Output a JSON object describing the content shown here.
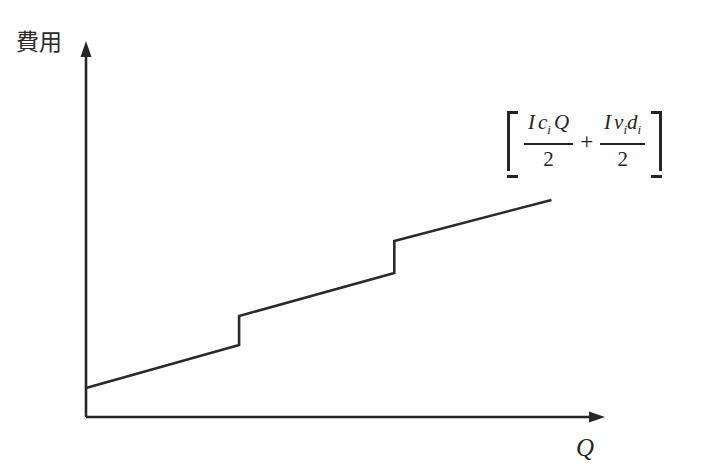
{
  "chart_data": {
    "type": "line",
    "title": "",
    "subtitle": "",
    "xlabel": "Q",
    "ylabel": "費用",
    "grid": false,
    "legend": null,
    "axis_style": "arrow-headed axes, no tick marks, no numeric tick labels",
    "xlim": [
      0,
      1
    ],
    "ylim": [
      0,
      1
    ],
    "series": [
      {
        "name": "total cost",
        "segments": [
          {
            "x": [
              0.0,
              0.295
            ],
            "y": [
              0.078,
              0.193
            ]
          },
          {
            "x": [
              0.295,
              0.295
            ],
            "y": [
              0.193,
              0.271
            ]
          },
          {
            "x": [
              0.295,
              0.594
            ],
            "y": [
              0.271,
              0.386
            ]
          },
          {
            "x": [
              0.594,
              0.594
            ],
            "y": [
              0.386,
              0.472
            ]
          },
          {
            "x": [
              0.594,
              0.897
            ],
            "y": [
              0.472,
              0.582
            ]
          }
        ],
        "jumps_at_x": [
          0.295,
          0.594
        ]
      }
    ],
    "annotations": [
      {
        "name": "cost-formula",
        "position": {
          "x": 0.83,
          "y": 0.8
        },
        "latex": "\\left[\\frac{I\\,c_i Q}{2} + \\frac{I\\,v_i d_i}{2}\\right]",
        "terms": [
          {
            "numerator": "I c_i Q",
            "denominator": "2"
          },
          {
            "numerator": "I v_i d_i",
            "denominator": "2"
          }
        ],
        "operator": "+"
      }
    ]
  },
  "axes": {
    "y": {
      "label": "費用",
      "arrow": true
    },
    "x": {
      "label": "Q",
      "arrow": true
    }
  },
  "formula": {
    "bracket_open": "[",
    "bracket_close": "]",
    "operator": "+",
    "term1": {
      "numer_I": "I",
      "numer_c": "c",
      "numer_c_sub": "i",
      "numer_Q": "Q",
      "denom": "2"
    },
    "term2": {
      "numer_I": "I",
      "numer_v": "v",
      "numer_v_sub": "i",
      "numer_d": "d",
      "numer_d_sub": "i",
      "denom": "2"
    }
  },
  "colors": {
    "background": "#ffffff",
    "axis": "#262626",
    "curve": "#2a2a2a",
    "text": "#242424"
  }
}
